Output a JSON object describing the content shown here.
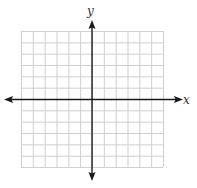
{
  "chart_data": {
    "type": "scatter",
    "title": "",
    "xlabel": "x",
    "ylabel": "y",
    "grid": true,
    "grid_cells": {
      "columns": 12,
      "rows": 12
    },
    "xlim": [
      -6,
      6
    ],
    "ylim": [
      -6,
      6
    ],
    "points": [],
    "axes_arrows": true
  },
  "axes": {
    "x_label": "x",
    "y_label": "y"
  },
  "colors": {
    "grid": "#cfcfcf",
    "axis": "#1a1a1a",
    "background": "#ffffff"
  }
}
